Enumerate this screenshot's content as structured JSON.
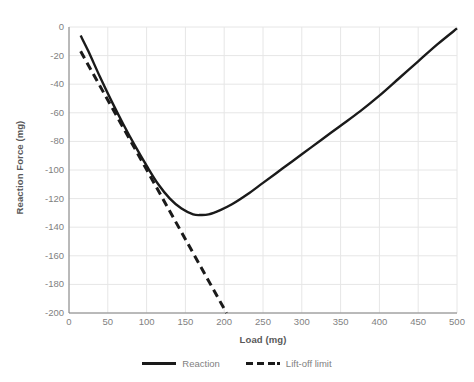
{
  "chart_data": {
    "type": "line",
    "title": "",
    "xlabel": "Load (mg)",
    "ylabel": "Reaction Force (mg)",
    "xlim": [
      0,
      500
    ],
    "ylim": [
      -200,
      0
    ],
    "xticks": [
      0,
      50,
      100,
      150,
      200,
      250,
      300,
      350,
      400,
      450,
      500
    ],
    "yticks": [
      0,
      -20,
      -40,
      -60,
      -80,
      -100,
      -120,
      -140,
      -160,
      -180,
      -200
    ],
    "xtick_labels": [
      "0",
      "50",
      "100",
      "150",
      "200",
      "250",
      "300",
      "350",
      "400",
      "450",
      "500"
    ],
    "ytick_labels": [
      "0",
      "-20",
      "-40",
      "-60",
      "-80",
      "-100",
      "-120",
      "-140",
      "-160",
      "-180",
      "-200"
    ],
    "grid": true,
    "legend_position": "bottom",
    "series": [
      {
        "name": "Reaction",
        "style": "solid",
        "color": "#1a1a1a",
        "x": [
          15,
          25,
          40,
          55,
          70,
          85,
          100,
          115,
          130,
          145,
          160,
          170,
          180,
          195,
          210,
          230,
          250,
          275,
          300,
          325,
          350,
          375,
          400,
          425,
          450,
          475,
          500
        ],
        "y": [
          -6,
          -17,
          -35,
          -52,
          -68,
          -83,
          -97,
          -110,
          -120,
          -127,
          -131,
          -131.5,
          -131,
          -128,
          -124,
          -117,
          -109,
          -99,
          -89,
          -79,
          -69,
          -59,
          -48,
          -36,
          -24,
          -12,
          -1
        ]
      },
      {
        "name": "Lift-off limit",
        "style": "dashed",
        "color": "#1a1a1a",
        "x": [
          15,
          203
        ],
        "y": [
          -17,
          -200
        ]
      }
    ]
  },
  "legend": {
    "items": [
      {
        "label": "Reaction",
        "style": "solid"
      },
      {
        "label": "Lift-off limit",
        "style": "dashed"
      }
    ]
  },
  "colors": {
    "series_line": "#1a1a1a",
    "grid": "#e6e6e6",
    "axis": "#808080",
    "tick_text": "#7f7f7f",
    "title_text": "#595959",
    "background": "#ffffff"
  }
}
